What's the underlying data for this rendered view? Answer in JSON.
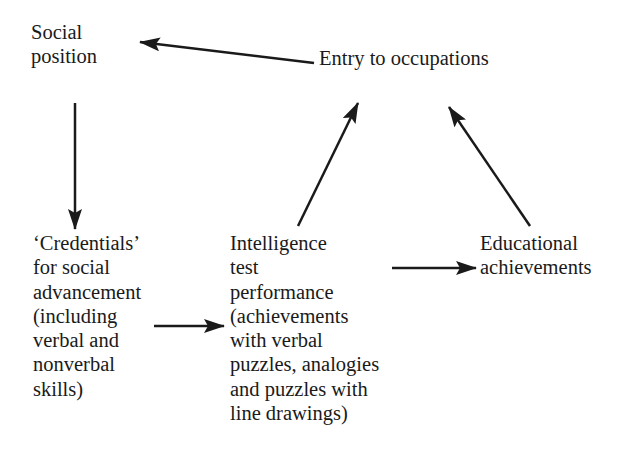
{
  "diagram": {
    "nodes": {
      "social_position": {
        "lines": [
          "Social",
          "position"
        ]
      },
      "entry_occupations": {
        "lines": [
          "Entry to occupations"
        ]
      },
      "credentials": {
        "lines": [
          "‘Credentials’",
          "for social",
          "advancement",
          "(including",
          "verbal and",
          "nonverbal",
          "skills)"
        ]
      },
      "intelligence": {
        "lines": [
          "Intelligence",
          "test",
          "performance",
          "(achievements",
          "with verbal",
          "puzzles, analogies",
          "and puzzles with",
          "line drawings)"
        ]
      },
      "educational": {
        "lines": [
          "Educational",
          "achievements"
        ]
      }
    },
    "edges": [
      {
        "from": "entry_occupations",
        "to": "social_position"
      },
      {
        "from": "social_position",
        "to": "credentials"
      },
      {
        "from": "credentials",
        "to": "intelligence"
      },
      {
        "from": "intelligence",
        "to": "entry_occupations"
      },
      {
        "from": "intelligence",
        "to": "educational"
      },
      {
        "from": "educational",
        "to": "entry_occupations"
      }
    ],
    "colors": {
      "ink": "#1a1a1a",
      "background": "#ffffff"
    }
  }
}
